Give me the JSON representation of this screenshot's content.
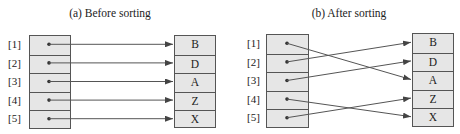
{
  "panels": [
    {
      "title": "(a) Before sorting",
      "indices": [
        "[1]",
        "[2]",
        "[3]",
        "[4]",
        "[5]"
      ],
      "values": [
        "B",
        "D",
        "A",
        "Z",
        "X"
      ],
      "pointers": [
        {
          "from": 1,
          "to": 1
        },
        {
          "from": 2,
          "to": 2
        },
        {
          "from": 3,
          "to": 3
        },
        {
          "from": 4,
          "to": 4
        },
        {
          "from": 5,
          "to": 5
        }
      ]
    },
    {
      "title": "(b) After sorting",
      "indices": [
        "[1]",
        "[2]",
        "[3]",
        "[4]",
        "[5]"
      ],
      "values": [
        "B",
        "D",
        "A",
        "Z",
        "X"
      ],
      "pointers": [
        {
          "from": 1,
          "to": 3
        },
        {
          "from": 2,
          "to": 1
        },
        {
          "from": 3,
          "to": 2
        },
        {
          "from": 4,
          "to": 5
        },
        {
          "from": 5,
          "to": 4
        }
      ]
    }
  ],
  "colors": {
    "cell_fill": "#e6e6e6",
    "stroke": "#555555",
    "arrow": "#444444"
  }
}
